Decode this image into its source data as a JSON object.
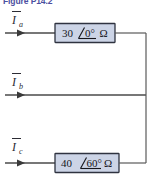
{
  "figure": {
    "caption": "Figure P14.2",
    "caption_color": "#4b4fa0",
    "width": 157,
    "height": 184
  },
  "colors": {
    "wire": "#4a4a4a",
    "impedance_fill": "#ccd4e6",
    "impedance_border": "#2f3340",
    "text": "#16161c"
  },
  "circuit": {
    "type": "three-phase-line-diagram",
    "branches": [
      {
        "id": "branch-a",
        "current_label": "I",
        "current_subscript": "a",
        "has_phasor_mark": true,
        "impedance_magnitude": "30",
        "impedance_angle": "0°",
        "impedance_unit": "Ω",
        "impedance_text": "30 ∠0° Ω",
        "has_impedance_box": true
      },
      {
        "id": "branch-b",
        "current_label": "I",
        "current_subscript": "b",
        "has_phasor_mark": true,
        "impedance_magnitude": "",
        "impedance_angle": "",
        "impedance_unit": "",
        "impedance_text": "",
        "has_impedance_box": false
      },
      {
        "id": "branch-c",
        "current_label": "I",
        "current_subscript": "c",
        "has_phasor_mark": true,
        "impedance_magnitude": "40",
        "impedance_angle": "60°",
        "impedance_unit": "Ω",
        "impedance_text": "40 ∠60° Ω",
        "has_impedance_box": true
      }
    ],
    "common_bus": {
      "name": "right-vertical-bus",
      "description": "vertical conductor tying all three branches together"
    }
  }
}
